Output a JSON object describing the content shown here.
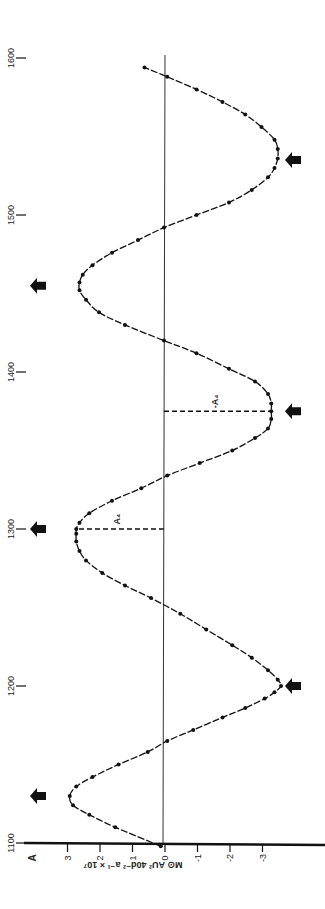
{
  "chart_data": {
    "type": "line",
    "orientation": "rotated-90-ccw",
    "title": "",
    "xlabel": "A",
    "ylabel": "M⊙ AU² 40d⁻² a⁻¹ × 10⁷",
    "x_ticks": [
      1100,
      1200,
      1300,
      1400,
      1500,
      1600
    ],
    "y_ticks": [
      3,
      2,
      1,
      0,
      -1,
      -2,
      -3
    ],
    "xlim": [
      1100,
      1600
    ],
    "ylim": [
      -3.9,
      3.6
    ],
    "grid": false,
    "legend": null,
    "annotations": [
      {
        "text": "A₄",
        "x": 1300,
        "y": 2.7,
        "type": "dashed-drop-line"
      },
      {
        "text": "-A₄",
        "x": 1375,
        "y": -3.3,
        "type": "dashed-drop-line"
      }
    ],
    "arrow_markers": [
      {
        "x": 1130,
        "side": "positive"
      },
      {
        "x": 1200,
        "side": "negative"
      },
      {
        "x": 1300,
        "side": "positive"
      },
      {
        "x": 1375,
        "side": "negative"
      },
      {
        "x": 1455,
        "side": "positive"
      },
      {
        "x": 1535,
        "side": "negative"
      }
    ],
    "series": [
      {
        "name": "curve",
        "x": [
          1098,
          1110,
          1118,
          1124,
          1130,
          1136,
          1142,
          1150,
          1158,
          1165,
          1172,
          1180,
          1186,
          1192,
          1196,
          1200,
          1204,
          1210,
          1218,
          1226,
          1236,
          1246,
          1256,
          1264,
          1272,
          1280,
          1286,
          1292,
          1297,
          1300,
          1304,
          1310,
          1318,
          1326,
          1334,
          1342,
          1350,
          1358,
          1364,
          1370,
          1375,
          1380,
          1386,
          1394,
          1402,
          1412,
          1420,
          1430,
          1438,
          1446,
          1452,
          1457,
          1462,
          1468,
          1476,
          1484,
          1492,
          1500,
          1508,
          1516,
          1524,
          1530,
          1536,
          1542,
          1548,
          1556,
          1564,
          1572,
          1580,
          1588,
          1594
        ],
        "y": [
          0.1,
          1.5,
          2.3,
          2.8,
          2.9,
          2.7,
          2.2,
          1.4,
          0.5,
          -0.1,
          -0.9,
          -1.8,
          -2.5,
          -3.1,
          -3.4,
          -3.6,
          -3.5,
          -3.2,
          -2.7,
          -2.1,
          -1.3,
          -0.5,
          0.4,
          1.2,
          1.9,
          2.4,
          2.6,
          2.7,
          2.7,
          2.7,
          2.6,
          2.3,
          1.6,
          0.7,
          -0.1,
          -1.1,
          -2.1,
          -2.8,
          -3.2,
          -3.3,
          -3.3,
          -3.3,
          -3.2,
          -2.8,
          -2.0,
          -1.0,
          0.0,
          1.2,
          2.0,
          2.4,
          2.6,
          2.6,
          2.5,
          2.2,
          1.6,
          0.8,
          0.0,
          -1.0,
          -2.0,
          -2.7,
          -3.2,
          -3.4,
          -3.5,
          -3.5,
          -3.4,
          -3.0,
          -2.5,
          -1.8,
          -1.0,
          -0.1,
          0.6
        ]
      }
    ]
  }
}
